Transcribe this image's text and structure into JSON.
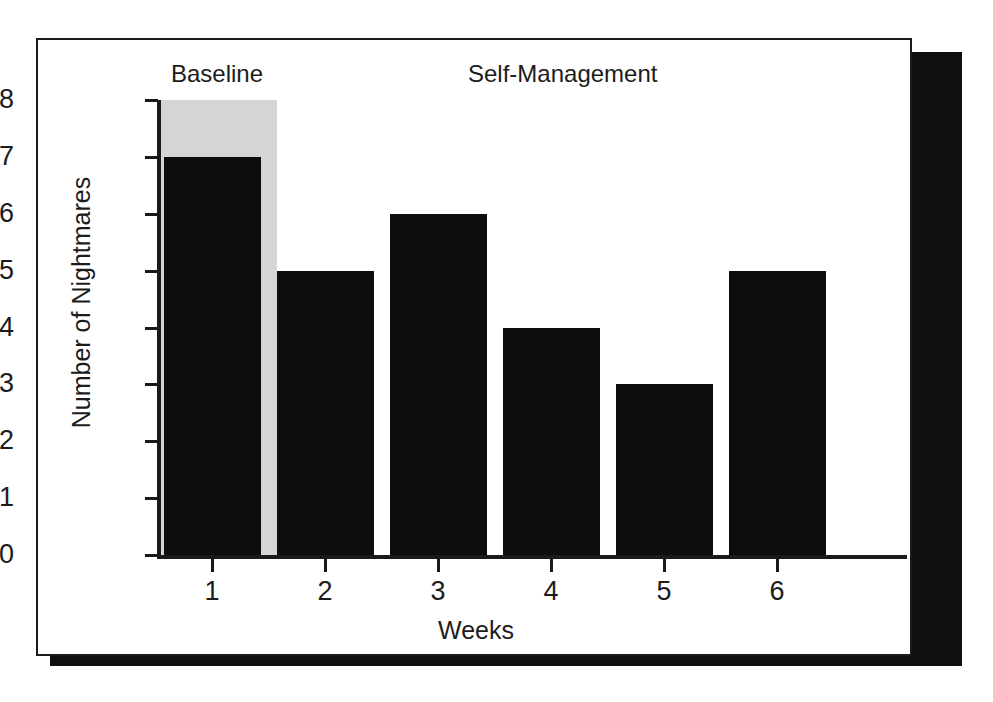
{
  "figure": {
    "background_color": "#ffffff",
    "frame_border_color": "#1a1a1a",
    "shadow_color": "#100f0f"
  },
  "chart_data": {
    "type": "bar",
    "title": "",
    "subtitle": "",
    "xlabel": "Weeks",
    "ylabel": "Number of Nightmares",
    "categories": [
      "1",
      "2",
      "3",
      "4",
      "5",
      "6"
    ],
    "values": [
      7,
      5,
      6,
      4,
      3,
      5
    ],
    "series": [
      {
        "name": "Number of Nightmares",
        "values": [
          7,
          5,
          6,
          4,
          3,
          5
        ],
        "color": "#0d0d0d"
      }
    ],
    "ylim": [
      0,
      8
    ],
    "xlim": [
      0.4,
      6.6
    ],
    "ytick_labels": [
      "0",
      "1",
      "2",
      "3",
      "4",
      "5",
      "6",
      "7",
      "8"
    ],
    "ytick_values": [
      0,
      1,
      2,
      3,
      4,
      5,
      6,
      7,
      8
    ],
    "xtick_labels": [
      "1",
      "2",
      "3",
      "4",
      "5",
      "6"
    ],
    "grid": false,
    "legend_position": "none",
    "bar_color": "#0d0d0d",
    "annotations": [
      {
        "text": "Baseline",
        "kind": "phase-label",
        "covers_categories": [
          "1"
        ]
      },
      {
        "text": "Self-Management",
        "kind": "phase-label",
        "covers_categories": [
          "2",
          "3",
          "4",
          "5",
          "6"
        ]
      }
    ],
    "phase_shading": [
      {
        "label": "Baseline",
        "from_category": "1",
        "to_category": "1",
        "color": "#d5d5d5",
        "y_from": 0,
        "y_to": 8
      }
    ]
  },
  "axes": {
    "y_title": "Number of Nightmares",
    "x_title": "Weeks",
    "y_ticks": [
      "8",
      "7",
      "6",
      "5",
      "4",
      "3",
      "2",
      "1",
      "0"
    ],
    "x_ticks": [
      "1",
      "2",
      "3",
      "4",
      "5",
      "6"
    ]
  },
  "phases": {
    "baseline_label": "Baseline",
    "treatment_label": "Self-Management"
  }
}
